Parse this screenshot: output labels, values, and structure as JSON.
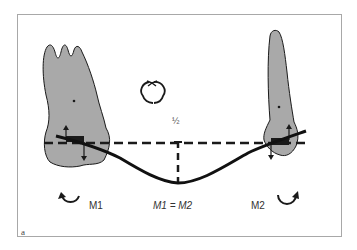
{
  "figure": {
    "panel_label": "a",
    "labels": {
      "moment_left": "M1",
      "moment_right": "M2",
      "equation": "M1 = M2",
      "midpoint": "½"
    },
    "icons": {
      "rotation_center": "circular-arrows-icon",
      "moment_left_arrow": "counterclockwise-arrow-icon",
      "moment_right_arrow": "clockwise-arrow-icon"
    },
    "colors": {
      "tooth_fill": "#a9a9a9",
      "outline": "#1a1a1a",
      "frame_border": "#a8a8a8",
      "text": "#333333"
    },
    "elements": [
      "left-tooth (molar)",
      "right-tooth (premolar)",
      "horizontal-dashed-reference-line",
      "vertical-dashed-midpoint-line",
      "curved-wire",
      "left-bracket",
      "right-bracket"
    ]
  }
}
